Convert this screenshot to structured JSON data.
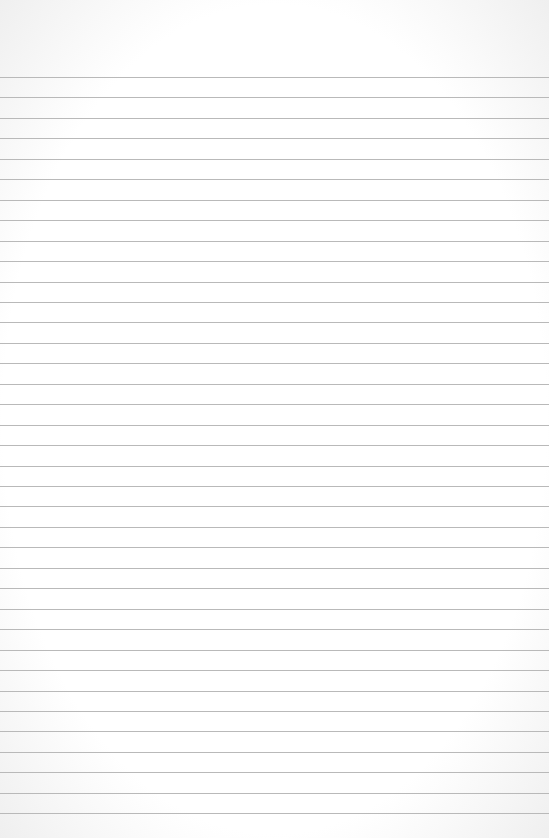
{
  "paper": {
    "type": "lined-paper",
    "background_color": "#ffffff",
    "line_color": "#b9b9b9",
    "line_count": 37,
    "first_line_y": 77,
    "line_spacing": 20.45,
    "text": ""
  }
}
